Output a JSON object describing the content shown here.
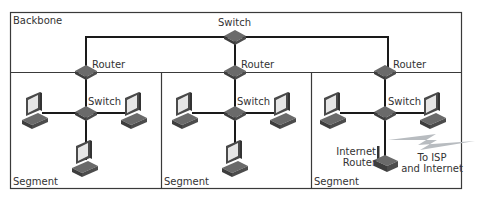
{
  "diagram": {
    "backbone_label": "Backbone",
    "backbone_switch_label": "Switch",
    "segments": [
      {
        "label": "Segment",
        "router_label": "Router",
        "switch_label": "Switch",
        "computers": 3
      },
      {
        "label": "Segment",
        "router_label": "Router",
        "switch_label": "Switch",
        "computers": 3
      },
      {
        "label": "Segment",
        "router_label": "Router",
        "switch_label": "Switch",
        "computers": 2,
        "internet_router_label_line1": "Internet",
        "internet_router_label_line2": "Router",
        "isp_label_line1": "To ISP",
        "isp_label_line2": "and Internet"
      }
    ]
  },
  "colors": {
    "border": "#3a3a3a",
    "device": "#5a5a5a",
    "device_dark": "#3c3c3c",
    "screen": "#e8e8e8",
    "bolt": "#b8bcc0"
  }
}
